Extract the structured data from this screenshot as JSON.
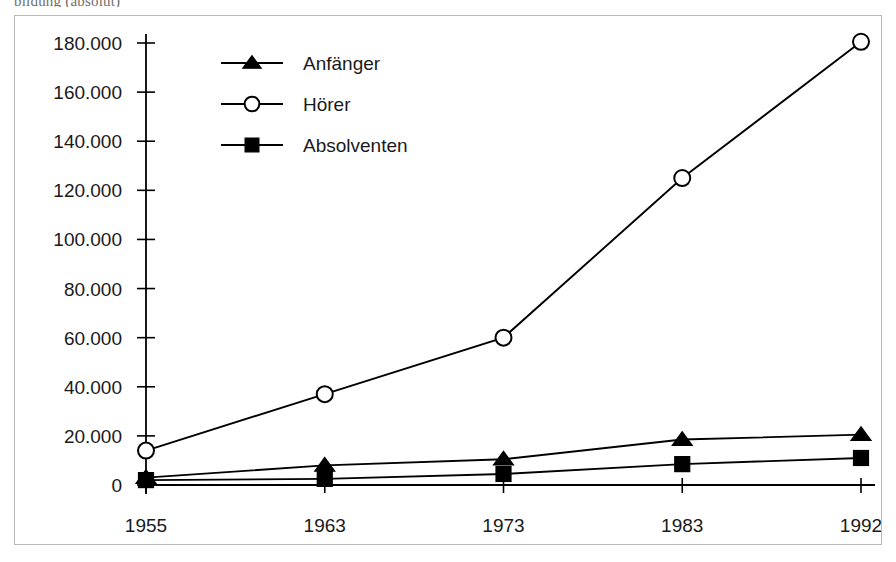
{
  "caption_fragment": "bildung (absolut)",
  "chart_data": {
    "type": "line",
    "title": "",
    "xlabel": "",
    "ylabel": "",
    "categories": [
      "1955",
      "1963",
      "1973",
      "1983",
      "1992"
    ],
    "x": [
      1955,
      1963,
      1973,
      1983,
      1992
    ],
    "ylim": [
      0,
      180000
    ],
    "yticks": [
      0,
      20000,
      40000,
      60000,
      80000,
      100000,
      120000,
      140000,
      160000,
      180000
    ],
    "ytick_labels": [
      "0",
      "20.000",
      "40.000",
      "60.000",
      "80.000",
      "100.000",
      "120.000",
      "140.000",
      "160.000",
      "180.000"
    ],
    "grid": false,
    "legend_position": "top-left-inside",
    "number_format": "de-DE",
    "series": [
      {
        "name": "Anfänger",
        "marker": "triangle-filled",
        "values": [
          3000,
          8000,
          10500,
          18500,
          20500
        ]
      },
      {
        "name": "Hörer",
        "marker": "circle-open",
        "values": [
          14000,
          37000,
          60000,
          125000,
          180500
        ]
      },
      {
        "name": "Absolventen",
        "marker": "square-filled",
        "values": [
          2000,
          2500,
          4500,
          8500,
          11000
        ]
      }
    ]
  },
  "legend": {
    "items": [
      {
        "label": "Anfänger",
        "marker": "triangle-filled"
      },
      {
        "label": "Hörer",
        "marker": "circle-open"
      },
      {
        "label": "Absolventen",
        "marker": "square-filled"
      }
    ]
  },
  "colors": {
    "ink": "#000000",
    "frame": "#b9b9b9",
    "background": "#ffffff",
    "caption": "#6e6e6e"
  }
}
